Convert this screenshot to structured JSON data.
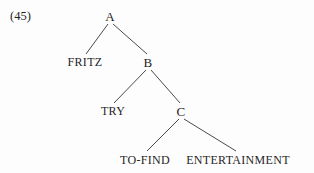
{
  "figure": {
    "example_number": "(45)",
    "kind": "syntax-tree",
    "background_color": "#fdfdfd",
    "line_color": "#4a4a4a",
    "text_color": "#1f1f1f"
  },
  "tree": {
    "nodes": [
      {
        "id": "A",
        "label": "A",
        "type": "nonterminal",
        "x": 110,
        "y": 16,
        "level": 0
      },
      {
        "id": "FRITZ",
        "label": "FRITZ",
        "type": "terminal",
        "x": 85,
        "y": 62,
        "level": 1
      },
      {
        "id": "B",
        "label": "B",
        "type": "nonterminal",
        "x": 148,
        "y": 62,
        "level": 1
      },
      {
        "id": "TRY",
        "label": "TRY",
        "type": "terminal",
        "x": 113,
        "y": 111,
        "level": 2
      },
      {
        "id": "C",
        "label": "C",
        "type": "nonterminal",
        "x": 181,
        "y": 111,
        "level": 2
      },
      {
        "id": "TO-FIND",
        "label": "TO-FIND",
        "type": "terminal",
        "x": 145,
        "y": 160,
        "level": 3
      },
      {
        "id": "ENTERTAINMENT",
        "label": "ENTERTAINMENT",
        "type": "terminal",
        "x": 238,
        "y": 160,
        "level": 3
      }
    ],
    "edges": [
      {
        "id": "edge-a-fritz",
        "from": "A",
        "to": "FRITZ",
        "x1": 108,
        "y1": 24,
        "x2": 86,
        "y2": 54
      },
      {
        "id": "edge-a-b",
        "from": "A",
        "to": "B",
        "x1": 113,
        "y1": 24,
        "x2": 147,
        "y2": 54
      },
      {
        "id": "edge-b-try",
        "from": "B",
        "to": "TRY",
        "x1": 146,
        "y1": 70,
        "x2": 114,
        "y2": 103
      },
      {
        "id": "edge-b-c",
        "from": "B",
        "to": "C",
        "x1": 151,
        "y1": 70,
        "x2": 180,
        "y2": 103
      },
      {
        "id": "edge-c-tofind",
        "from": "C",
        "to": "TO-FIND",
        "x1": 179,
        "y1": 119,
        "x2": 147,
        "y2": 151
      },
      {
        "id": "edge-c-entert",
        "from": "C",
        "to": "ENTERTAINMENT",
        "x1": 184,
        "y1": 119,
        "x2": 236,
        "y2": 151
      }
    ]
  }
}
